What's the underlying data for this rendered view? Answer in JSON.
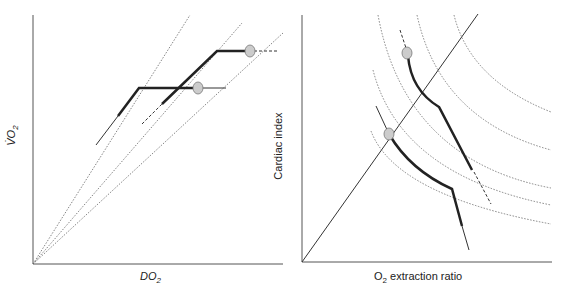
{
  "left_panel": {
    "x_label_main": "DO",
    "x_label_sub": "2",
    "y_label_main": "V̇O",
    "y_label_sub": "2"
  },
  "right_panel": {
    "x_label_main": "O",
    "x_label_sub": "2",
    "x_label_rest": " extraction ratio",
    "y_label": "Cardiac index"
  },
  "colors": {
    "axis": "#555555",
    "thick_line": "#222222",
    "thin_line": "#333333",
    "dotted": "#666666",
    "marker_fill": "#cccccc",
    "marker_stroke": "#777777"
  }
}
